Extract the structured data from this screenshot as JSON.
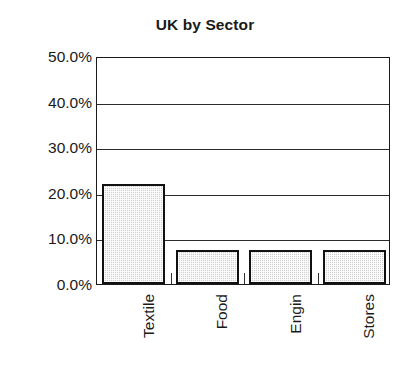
{
  "chart_data": {
    "type": "bar",
    "title": "UK by Sector",
    "xlabel": "",
    "ylabel": "",
    "categories": [
      "Textile",
      "Food",
      "Engin",
      "Stores"
    ],
    "values": [
      22.0,
      7.4,
      7.4,
      7.4
    ],
    "value_labels": [
      "22.0%",
      "7.4%",
      "7.4%",
      "7.4%"
    ],
    "ylim": [
      0,
      50
    ],
    "ytick_values": [
      0,
      10,
      20,
      30,
      40,
      50
    ],
    "ytick_labels": [
      "0.0%",
      "10.0%",
      "20.0%",
      "30.0%",
      "40.0%",
      "50.0%"
    ],
    "grid": true,
    "grid_axis": "y",
    "legend": null,
    "legend_position": "none",
    "series": [
      {
        "name": "UK by Sector",
        "values": [
          22.0,
          7.4,
          7.4,
          7.4
        ]
      }
    ],
    "style": {
      "bar_fill": "#cfcfcf",
      "bar_fill_pattern": "fine-stipple",
      "bar_border": "#111111",
      "axis_color": "#1a1a1a",
      "grid_color": "#2b2b2b",
      "background": "#ffffff",
      "text_color": "#1a1a1a",
      "xlabel_rotation": -90
    }
  }
}
